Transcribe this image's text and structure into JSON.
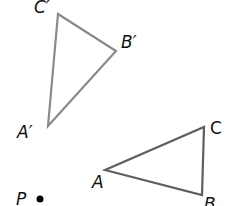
{
  "diagram": {
    "colors": {
      "image_triangle_stroke": "#8a8a8a",
      "original_triangle_stroke": "#5e5e5e",
      "point_fill": "#000000",
      "label_color": "#111111"
    },
    "image_triangle": {
      "name": "A'B'C'",
      "vertices": {
        "A": {
          "label": "A′",
          "x": 48,
          "y": 126
        },
        "B": {
          "label": "B′",
          "x": 116,
          "y": 51
        },
        "C": {
          "label": "C′",
          "x": 58,
          "y": 14
        }
      }
    },
    "original_triangle": {
      "name": "ABC",
      "vertices": {
        "A": {
          "label": "A",
          "x": 105,
          "y": 170
        },
        "B": {
          "label": "B",
          "x": 202,
          "y": 195
        },
        "C": {
          "label": "C",
          "x": 204,
          "y": 127
        }
      }
    },
    "point": {
      "label": "P",
      "x": 40,
      "y": 199,
      "r": 3.5
    }
  }
}
